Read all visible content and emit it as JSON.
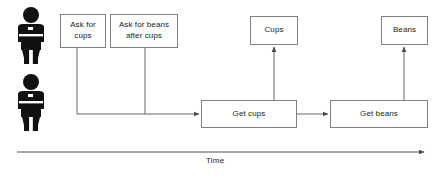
{
  "diagram": {
    "background_color": "#ffffff",
    "box_border_color": "#808080",
    "line_color": "#666666",
    "text_color": "#1a1a1a",
    "actors": [
      {
        "name": "actor-top",
        "icon": "person-icon",
        "x": 12,
        "y": 6
      },
      {
        "name": "actor-bottom",
        "icon": "person-icon",
        "x": 12,
        "y": 73
      }
    ],
    "nodes": [
      {
        "id": "ask-for-cups",
        "label": "Ask for\ncups",
        "x": 60,
        "y": 14,
        "w": 46,
        "h": 34
      },
      {
        "id": "ask-for-beans-after-cups",
        "label": "Ask for beans\nafter cups",
        "x": 110,
        "y": 14,
        "w": 68,
        "h": 34
      },
      {
        "id": "cups",
        "label": "Cups",
        "x": 250,
        "y": 16,
        "w": 48,
        "h": 29
      },
      {
        "id": "beans",
        "label": "Beans",
        "x": 381,
        "y": 16,
        "w": 47,
        "h": 29
      },
      {
        "id": "get-cups",
        "label": "Get cups",
        "x": 201,
        "y": 100,
        "w": 96,
        "h": 28
      },
      {
        "id": "get-beans",
        "label": "Get beans",
        "x": 330,
        "y": 100,
        "w": 98,
        "h": 28
      }
    ],
    "axis": {
      "label": "Time",
      "label_x": 206,
      "label_y": 158,
      "line_start_x": 17,
      "line_end_x": 427,
      "line_y": 152
    }
  }
}
